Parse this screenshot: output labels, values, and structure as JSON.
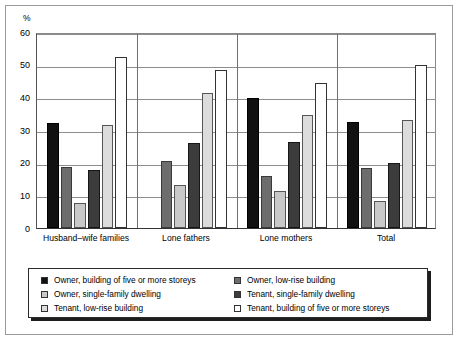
{
  "chart_data": {
    "type": "bar",
    "title": "",
    "subtitle": "",
    "xlabel": "",
    "ylabel": "%",
    "unit_label": "%",
    "ylim": [
      0,
      60
    ],
    "ytick_labels": [
      "0",
      "10",
      "20",
      "30",
      "40",
      "50",
      "60"
    ],
    "ytick_values": [
      0,
      10,
      20,
      30,
      40,
      50,
      60
    ],
    "grid": true,
    "legend_position": "bottom",
    "categories": [
      "Husband–wife families",
      "Lone fathers",
      "Lone mothers",
      "Total"
    ],
    "series": [
      {
        "name": "Owner, building of five or more storeys",
        "color": "#111111",
        "values": [
          32.3,
          0,
          39.8,
          32.6
        ]
      },
      {
        "name": "Owner, low-rise building",
        "color": "#6d6d6d",
        "values": [
          18.8,
          20.5,
          16.0,
          18.3
        ]
      },
      {
        "name": "Owner, single-family dwelling",
        "color": "#c9c9c9",
        "values": [
          7.8,
          13.1,
          11.4,
          8.2
        ]
      },
      {
        "name": "Tenant, single-family dwelling",
        "color": "#3c3c3c",
        "values": [
          17.8,
          26.1,
          26.3,
          20.0
        ]
      },
      {
        "name": "Tenant, low-rise building",
        "color": "#dcdcdc",
        "values": [
          31.6,
          41.3,
          34.7,
          33.0
        ]
      },
      {
        "name": "Tenant, building of five or more storeys",
        "color": "#ffffff",
        "values": [
          52.2,
          48.4,
          44.3,
          50.0
        ]
      }
    ]
  },
  "legend": {
    "left_items": [
      "Owner, building of five or more storeys",
      "Owner, single-family dwelling",
      "Tenant, low-rise building"
    ],
    "right_items": [
      "Owner, low-rise building",
      "Tenant, single-family dwelling",
      "Tenant, building of five or more storeys"
    ],
    "left_colors": [
      "#111111",
      "#c9c9c9",
      "#dcdcdc"
    ],
    "right_colors": [
      "#6d6d6d",
      "#3c3c3c",
      "#ffffff"
    ]
  }
}
